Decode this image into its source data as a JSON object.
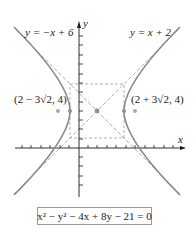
{
  "figure": {
    "type": "hyperbola-graph",
    "axes": {
      "x_label": "x",
      "y_label": "y"
    },
    "asymptotes": [
      {
        "label": "y = −x + 6",
        "equation": "y = -x + 6"
      },
      {
        "label": "y = x + 2",
        "equation": "y = x + 2"
      }
    ],
    "points": [
      {
        "label": "(2 − 3√2, 4)"
      },
      {
        "label": "(2 + 3√2, 4)"
      }
    ],
    "equation_box": "x² − y² − 4x + 8y − 21 = 0",
    "colors": {
      "curve": "#8a8a8a",
      "dashed": "#9a9a9a",
      "axis": "#1a1a1a",
      "point": "#8f8f8f"
    }
  }
}
